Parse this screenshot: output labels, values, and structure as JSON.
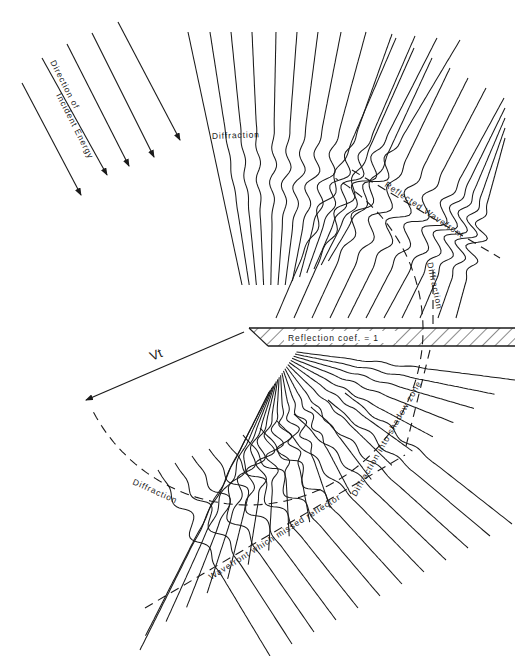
{
  "figure": {
    "colors": {
      "ink": "#1a1a1a",
      "background": "#ffffff"
    },
    "edge_point": {
      "x": 248,
      "y": 330
    },
    "radius_px": 175,
    "incident_arrows": {
      "count": 6,
      "direction_deg": 63
    },
    "reflector": {
      "top_y": 328,
      "bottom_y": 346,
      "left_top_x": 249,
      "left_bottom_x": 268,
      "right_x": 515,
      "hatch": "diagonal"
    }
  },
  "labels": {
    "incident_direction_line1": "Direction of",
    "incident_direction_line2": "Incident Energy",
    "diffraction_top": "Diffraction",
    "reflected_wavefront": "Reflected Wavefront",
    "diffraction_right": "Diffraction",
    "reflection_coef": "Reflection coef. = 1",
    "vt": "Vt",
    "diffraction_left_lower": "Diffraction",
    "wavefront_missed": "Wavefront which missed reflector",
    "diffraction_shadow": "Diffraction into shadow zone"
  }
}
